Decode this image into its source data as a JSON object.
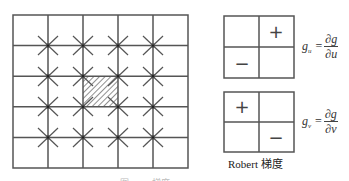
{
  "diagram": {
    "grid": {
      "cols": 5,
      "rows": 5,
      "x": 13,
      "y": 15,
      "cell_w": 35,
      "cell_h": 30.6,
      "line_color": "#555555",
      "hatched_cell": {
        "col": 2,
        "row": 2
      },
      "star_intersections": "all 16 interior points"
    },
    "kernels": [
      {
        "name": "gu-kernel",
        "cells": [
          [
            "",
            "+"
          ],
          [
            "−",
            ""
          ]
        ],
        "formula": {
          "lhs": "g",
          "sub": "u",
          "num": "∂g",
          "den": "∂u"
        }
      },
      {
        "name": "gv-kernel",
        "cells": [
          [
            "+",
            ""
          ],
          [
            "",
            "−"
          ]
        ],
        "formula": {
          "lhs": "g",
          "sub": "v",
          "num": "∂g",
          "den": "∂v"
        }
      }
    ],
    "caption": "Robert 梯度",
    "figure_caption": "图 …… 梯度"
  }
}
